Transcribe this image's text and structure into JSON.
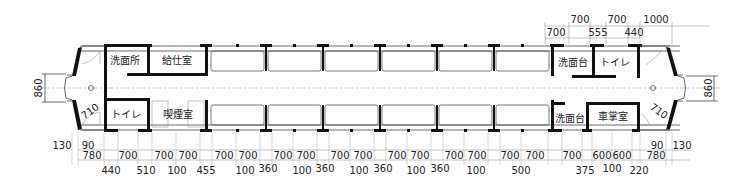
{
  "diagram": {
    "rooms": {
      "left_top_1": "洗面所",
      "left_top_2": "給仕室",
      "left_bottom_1": "トイレ",
      "left_bottom_2": "喫煙室",
      "right_top_1": "洗面台",
      "right_top_2": "トイレ",
      "right_bottom_1": "洗面台",
      "right_bottom_2": "車掌室"
    },
    "left_end": {
      "width_dim": "860",
      "door_dim": "710"
    },
    "right_end": {
      "width_dim": "860",
      "door_dim": "710"
    },
    "top_dims": {
      "row_upper": [
        "700",
        "700",
        "1000"
      ],
      "row_lower": [
        "700",
        "555",
        "440"
      ]
    },
    "bottom_dims": {
      "left_offsets": [
        "130",
        "90",
        "780"
      ],
      "row_upper": [
        "700",
        "700",
        "700",
        "700",
        "700",
        "700",
        "700",
        "700",
        "700",
        "700",
        "700",
        "700",
        "700",
        "700",
        "700",
        "700",
        "600",
        "600"
      ],
      "row_lower": [
        "440",
        "510",
        "100",
        "455",
        "100",
        "360",
        "100",
        "360",
        "100",
        "360",
        "100",
        "360",
        "100",
        "500",
        "375",
        "100",
        "220"
      ],
      "right_offsets": [
        "90",
        "130",
        "780"
      ]
    }
  }
}
